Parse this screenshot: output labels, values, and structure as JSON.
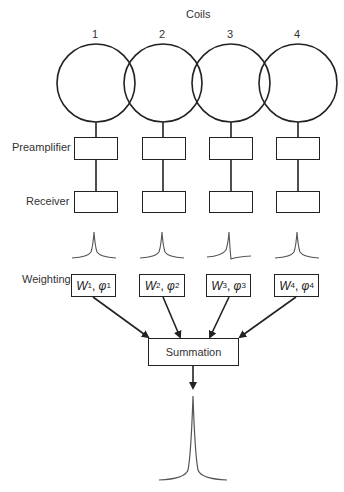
{
  "diagram": {
    "title": "Coils",
    "coils": [
      {
        "label": "1",
        "weight": "W",
        "weight_sub": "1",
        "phase": "φ",
        "phase_sub": "1"
      },
      {
        "label": "2",
        "weight": "W",
        "weight_sub": "2",
        "phase": "φ",
        "phase_sub": "2"
      },
      {
        "label": "3",
        "weight": "W",
        "weight_sub": "3",
        "phase": "φ",
        "phase_sub": "3"
      },
      {
        "label": "4",
        "weight": "W",
        "weight_sub": "4",
        "phase": "φ",
        "phase_sub": "4"
      }
    ],
    "stages": {
      "preamplifier": "Preamplifier",
      "receiver": "Receiver",
      "weighting": "Weighting",
      "summation": "Summation"
    },
    "colors": {
      "line": "#222222",
      "signal": "#555555",
      "background": "#ffffff"
    }
  }
}
